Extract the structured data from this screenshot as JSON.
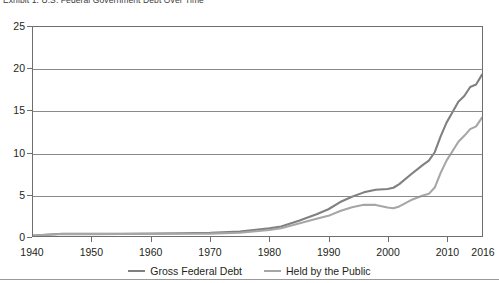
{
  "title": "Exhibit 1:  U.S. Federal Government Debt Over Time",
  "legend": {
    "position": "bottom-center",
    "items": [
      {
        "label": "Gross Federal Debt",
        "color": "#808080",
        "name": "gross-federal-debt"
      },
      {
        "label": "Held by the Public",
        "color": "#a6a6a6",
        "name": "held-by-the-public"
      }
    ]
  },
  "axis": {
    "y_ticks": [
      "0",
      "5",
      "10",
      "15",
      "20",
      "25"
    ],
    "x_ticks": [
      "1940",
      "1950",
      "1960",
      "1970",
      "1980",
      "1990",
      "2000",
      "2010",
      "2016"
    ]
  },
  "colors": {
    "frame": "#6e6e6e",
    "gridline": "#8a8a8a",
    "text": "#231f20",
    "series_gross": "#808080",
    "series_public": "#a6a6a6",
    "background": "#ffffff"
  },
  "chart_data": {
    "type": "line",
    "title": "Exhibit 1:  U.S. Federal Government Debt Over Time",
    "xlabel": "",
    "ylabel": "",
    "xlim": [
      1940,
      2016
    ],
    "ylim": [
      0,
      25
    ],
    "grid": true,
    "gridlines_y": [
      0,
      5,
      10,
      15,
      20,
      25
    ],
    "legend_position": "bottom-center",
    "x": [
      1940,
      1945,
      1950,
      1955,
      1960,
      1965,
      1970,
      1975,
      1980,
      1982,
      1985,
      1988,
      1990,
      1992,
      1994,
      1996,
      1998,
      2000,
      2001,
      2002,
      2004,
      2006,
      2007,
      2008,
      2009,
      2010,
      2011,
      2012,
      2013,
      2014,
      2015,
      2016
    ],
    "series": [
      {
        "name": "Gross Federal Debt",
        "color": "#808080",
        "values": [
          0.05,
          0.26,
          0.26,
          0.27,
          0.29,
          0.32,
          0.38,
          0.54,
          0.91,
          1.14,
          1.82,
          2.6,
          3.2,
          4.06,
          4.69,
          5.22,
          5.53,
          5.63,
          5.77,
          6.2,
          7.38,
          8.51,
          9.01,
          10.02,
          11.91,
          13.56,
          14.79,
          16.07,
          16.74,
          17.82,
          18.12,
          19.3
        ]
      },
      {
        "name": "Held by the Public",
        "color": "#a6a6a6",
        "values": [
          0.04,
          0.24,
          0.22,
          0.23,
          0.24,
          0.26,
          0.28,
          0.39,
          0.71,
          0.92,
          1.5,
          2.05,
          2.41,
          3.0,
          3.43,
          3.73,
          3.72,
          3.41,
          3.32,
          3.54,
          4.3,
          4.84,
          5.04,
          5.8,
          7.55,
          9.02,
          10.13,
          11.28,
          11.98,
          12.78,
          13.12,
          14.17
        ]
      }
    ]
  }
}
